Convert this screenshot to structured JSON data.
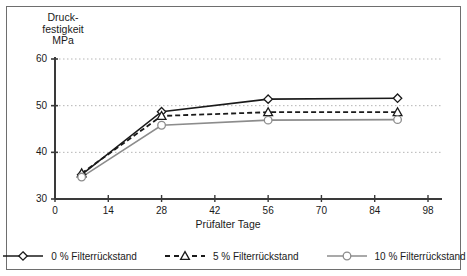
{
  "chart_data": {
    "type": "line",
    "title": "",
    "xlabel": "Prüfalter  Tage",
    "ylabel": "Druck-\nfestigkeit\nMPa",
    "ylabel_line1": "Druck-",
    "ylabel_line2": "festigkeit",
    "ylabel_line3": "MPa",
    "xlim": [
      0,
      98
    ],
    "ylim": [
      30,
      60
    ],
    "xticks": [
      0,
      14,
      28,
      42,
      56,
      70,
      84,
      98
    ],
    "yticks": [
      30,
      40,
      50,
      60
    ],
    "xtick_labels": [
      "0",
      "14",
      "28",
      "42",
      "56",
      "70",
      "84",
      "98"
    ],
    "ytick_labels": [
      "30",
      "40",
      "50",
      "60"
    ],
    "grid": "horizontal-dotted",
    "legend_position": "bottom",
    "x": [
      7,
      28,
      56,
      90
    ],
    "series": [
      {
        "name": "0 % Filterrückstand",
        "label": "0 % Filterrückstand",
        "marker": "diamond",
        "linestyle": "solid",
        "color": "#1a1a1a",
        "values": [
          35.2,
          48.7,
          51.4,
          51.6
        ]
      },
      {
        "name": "5 % Filterrückstand",
        "label": "5 % Filterrückstand",
        "marker": "triangle",
        "linestyle": "dashed",
        "color": "#1a1a1a",
        "values": [
          35.5,
          47.8,
          48.6,
          48.6
        ]
      },
      {
        "name": "10 % Filterrückstand",
        "label": "10 % Filterrückstand",
        "marker": "circle",
        "linestyle": "solid",
        "color": "#8c8c8c",
        "values": [
          34.7,
          45.8,
          46.9,
          47.0
        ]
      }
    ]
  },
  "colors": {
    "axis": "#3a3a3a",
    "grid": "#b5b5b5",
    "frame": "#6e6e6e",
    "series_dark": "#1a1a1a",
    "series_gray": "#8c8c8c",
    "text": "#1a1a1a"
  }
}
